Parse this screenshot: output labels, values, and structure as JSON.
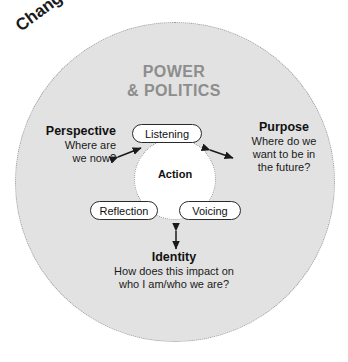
{
  "diagram": {
    "type": "concentric-circle-model",
    "outer_ring": {
      "label": "Change",
      "fill_color": "#e2e2e2",
      "border_style": "dotted",
      "border_color": "#9a9a9a"
    },
    "title": {
      "line1": "POWER",
      "line2": "& POLITICS",
      "color": "#8d8d8d"
    },
    "center": {
      "label": "Action",
      "fill_color": "#ffffff",
      "border_style": "dotted"
    },
    "pills": [
      {
        "label": "Listening",
        "position": "top"
      },
      {
        "label": "Reflection",
        "position": "bottom-left"
      },
      {
        "label": "Voicing",
        "position": "bottom-right"
      }
    ],
    "annotations": [
      {
        "heading": "Perspective",
        "line1": "Where are",
        "line2": "we now?",
        "position": "left",
        "arrow": "double"
      },
      {
        "heading": "Purpose",
        "line1": "Where do we",
        "line2": "want to be in",
        "line3": "the future?",
        "position": "right",
        "arrow": "double"
      },
      {
        "heading": "Identity",
        "line1": "How does this impact on",
        "line2": "who I am/who we are?",
        "position": "bottom",
        "arrow": "double"
      }
    ]
  }
}
